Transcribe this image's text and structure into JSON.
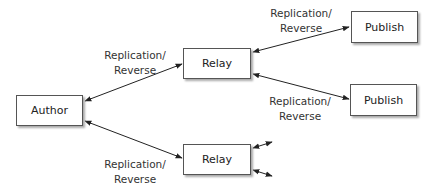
{
  "nodes": {
    "author": "Author",
    "relay_top": "Relay",
    "relay_bottom": "Relay",
    "publish_top": "Publish",
    "publish_bottom": "Publish"
  },
  "edges": [
    {
      "from": "Author",
      "to": "Relay (top)",
      "label_line1": "Replication/",
      "label_line2": "Reverse"
    },
    {
      "from": "Author",
      "to": "Relay (bottom)",
      "label_line1": "Replication/",
      "label_line2": "Reverse"
    },
    {
      "from": "Relay (top)",
      "to": "Publish (top)",
      "label_line1": "Replication/",
      "label_line2": "Reverse"
    },
    {
      "from": "Relay (top)",
      "to": "Publish (bottom)",
      "label_line1": "Replication/",
      "label_line2": "Reverse"
    }
  ]
}
